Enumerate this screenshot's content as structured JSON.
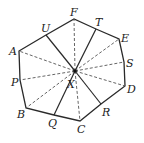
{
  "diagram": {
    "type": "geometry",
    "center": {
      "label": "X",
      "x": 75,
      "y": 71
    },
    "vertices": [
      {
        "label": "A",
        "x": 19,
        "y": 51
      },
      {
        "label": "B",
        "x": 26,
        "y": 108
      },
      {
        "label": "C",
        "x": 80,
        "y": 121
      },
      {
        "label": "D",
        "x": 125,
        "y": 86
      },
      {
        "label": "E",
        "x": 119,
        "y": 39
      },
      {
        "label": "F",
        "x": 74,
        "y": 19
      }
    ],
    "side_points": [
      {
        "label": "U",
        "x": 46,
        "y": 35
      },
      {
        "label": "T",
        "x": 96,
        "y": 29
      },
      {
        "label": "S",
        "x": 124,
        "y": 62
      },
      {
        "label": "R",
        "x": 101,
        "y": 104
      },
      {
        "label": "Q",
        "x": 54,
        "y": 115
      },
      {
        "label": "P",
        "x": 20,
        "y": 80
      }
    ],
    "solid_to": [
      "U",
      "T",
      "R",
      "Q"
    ],
    "dashed_to": [
      "A",
      "F",
      "E",
      "S",
      "D",
      "C",
      "B",
      "P"
    ],
    "labels": {
      "A": "A",
      "B": "B",
      "C": "C",
      "D": "D",
      "E": "E",
      "F": "F",
      "P": "P",
      "Q": "Q",
      "R": "R",
      "S": "S",
      "T": "T",
      "U": "U",
      "X": "X"
    },
    "colors": {
      "line": "#2a2a2a",
      "dash": "#555555",
      "background": "#ffffff"
    }
  }
}
